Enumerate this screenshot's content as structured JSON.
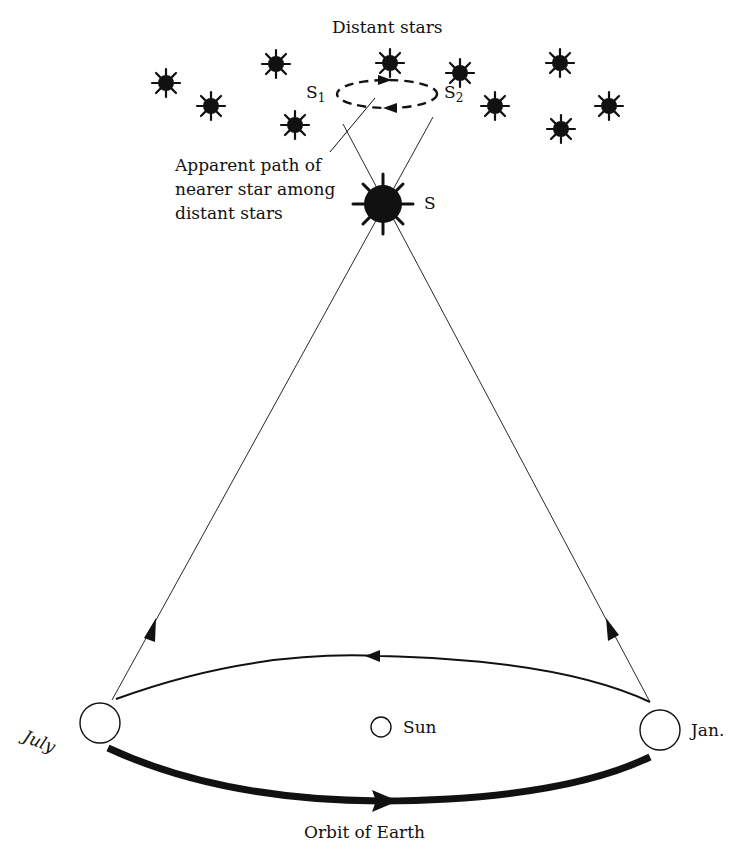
{
  "title": "Distant stars",
  "labels": {
    "s1": "S",
    "s1_sub": "1",
    "s2": "S",
    "s2_sub": "2",
    "s": "S",
    "apparent_path": "Apparent path of nearer star among distant stars",
    "july": "July",
    "jan": "Jan.",
    "sun": "Sun",
    "orbit": "Orbit of Earth"
  },
  "elements": {
    "distant_stars": [
      {
        "x": 166,
        "y": 83
      },
      {
        "x": 211,
        "y": 106
      },
      {
        "x": 276,
        "y": 64
      },
      {
        "x": 295,
        "y": 125
      },
      {
        "x": 390,
        "y": 63
      },
      {
        "x": 460,
        "y": 73
      },
      {
        "x": 495,
        "y": 106
      },
      {
        "x": 560,
        "y": 63
      },
      {
        "x": 561,
        "y": 129
      },
      {
        "x": 609,
        "y": 106
      }
    ],
    "near_star": {
      "x": 383,
      "y": 204,
      "label": "S"
    },
    "apparent_path_ellipse": {
      "cx": 387,
      "cy": 94,
      "rx": 50,
      "ry": 14
    },
    "earth_july": {
      "x": 100,
      "y": 723
    },
    "earth_jan": {
      "x": 660,
      "y": 730
    },
    "sun": {
      "x": 381,
      "y": 727
    }
  },
  "colors": {
    "ink": "#111111",
    "background": "#ffffff"
  }
}
